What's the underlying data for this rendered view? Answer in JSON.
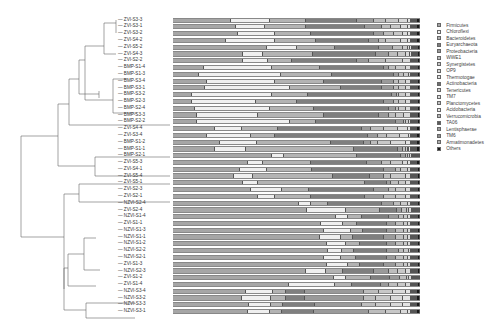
{
  "chart_data": {
    "type": "bar",
    "orientation": "horizontal",
    "stacked": true,
    "normalized_percent": true,
    "title": "",
    "xlabel": "",
    "ylabel": "",
    "xlim": [
      0,
      100
    ],
    "grid": false,
    "legend_position": "right",
    "has_dendrogram": true,
    "categories": [
      "ZVI-S3-3",
      "ZVI-S3-1",
      "ZVI-S3-2",
      "ZVI-S4-2",
      "ZVI-S5-2",
      "ZVI-S4-3",
      "ZVI-S2-2",
      "BMP-S1-4",
      "BMP-S1-3",
      "BMP-S3-4",
      "BMP-S3-1",
      "BMP-S3-2",
      "BMP-S2-3",
      "BMP-S2-4",
      "BMP-S3-3",
      "BMP-S2-2",
      "ZVI-S4-4",
      "ZVI-S3-4",
      "BMP-S1-2",
      "BMP-S1-1",
      "BMP-S2-1",
      "ZVI-S5-3",
      "ZVI-S4-1",
      "ZVI-S5-4",
      "ZVI-S5-1",
      "ZVI-S2-3",
      "ZVI-S2-1",
      "NZVI-S2-4",
      "ZVI-S2-4",
      "NZVI-S1-4",
      "ZVI-S1-1",
      "NZVI-S1-3",
      "NZVI-S1-1",
      "NZVI-S1-2",
      "NZVI-S2-2",
      "NZVI-S2-1",
      "ZVI-S1-3",
      "NZVI-S2-3",
      "ZVI-S1-2",
      "ZVI-S1-4",
      "NZVI-S3-4",
      "NZVI-S3-2",
      "NZVI-S3-3",
      "NZVI-S3-1"
    ],
    "legend": [
      "Firmicutes",
      "Chloroflexi",
      "Bacteroidetes",
      "Euryarchaeota",
      "Proteobacteria",
      "WWE1",
      "Synergistetes",
      "OP9",
      "Thermotogae",
      "Actinobacteria",
      "Tenericutes",
      "TM7",
      "Planctomycetes",
      "Acidobacteria",
      "Verrucomicrobia",
      "TA06",
      "Lentisphaerae",
      "TM6",
      "Armatimonadetes",
      "Others"
    ],
    "colors": [
      "#a6a6a6",
      "#efefef",
      "#b3b3b3",
      "#7f7f7f",
      "#9a9a9a",
      "#bdbdbd",
      "#c8c8c8",
      "#d9d9d9",
      "#e3e3e3",
      "#6e6e6e",
      "#cfcfcf",
      "#dedede",
      "#c2c2c2",
      "#e8e8e8",
      "#b8b8b8",
      "#5a5a5a",
      "#a0a0a0",
      "#909090",
      "#b0b0b0",
      "#1a1a1a"
    ],
    "series_values_note": "per-sample % for Firmicutes, Chloroflexi, Bacteroidetes, Euryarchaeota, Proteobacteria, then remaining small phyla lumped into listed order",
    "rows": [
      [
        24,
        16,
        15,
        21,
        7,
        5,
        5,
        4,
        1,
        0.5,
        0.5,
        0,
        0,
        0,
        0,
        0.5,
        0.2,
        0.1,
        0.1,
        1.1
      ],
      [
        26,
        12,
        17,
        24,
        7,
        4,
        4,
        3,
        1,
        0.5,
        0.5,
        0,
        0,
        0,
        0,
        0.5,
        0.2,
        0.1,
        0.1,
        1.1
      ],
      [
        27,
        15,
        15,
        26,
        4,
        4,
        4,
        2,
        1,
        0.5,
        0.5,
        0,
        0,
        0,
        0,
        0.5,
        0.2,
        0.1,
        0.1,
        1.1
      ],
      [
        22,
        20,
        17,
        22,
        4,
        3,
        6,
        3,
        1,
        0.5,
        0.5,
        0,
        0,
        0,
        0,
        0.5,
        0.2,
        0.1,
        0.1,
        1.1
      ],
      [
        39,
        12,
        16,
        18,
        6,
        4,
        2,
        1,
        0.5,
        0.5,
        0.3,
        0,
        0,
        0,
        0,
        0.3,
        0.2,
        0.1,
        0.1,
        0.9
      ],
      [
        29,
        8,
        21,
        26,
        5,
        4,
        3,
        2,
        0.5,
        0.5,
        0.3,
        0,
        0,
        0,
        0,
        0.3,
        0.2,
        0.1,
        0.1,
        0.9
      ],
      [
        29,
        10,
        10,
        27,
        5,
        7,
        7,
        3,
        0.5,
        0.3,
        0.2,
        0,
        0,
        0,
        0,
        0.3,
        0.2,
        0.1,
        0.1,
        0.9
      ],
      [
        13,
        28,
        20,
        27,
        2,
        3,
        4,
        2,
        0.5,
        0.3,
        0.2,
        0,
        0,
        0,
        0,
        0.3,
        0.2,
        0.1,
        0.1,
        0.8
      ],
      [
        11,
        34,
        21,
        26,
        2,
        2,
        2,
        1,
        0.3,
        0.2,
        0.2,
        0,
        0,
        0,
        0,
        0.3,
        0.2,
        0.1,
        0.1,
        0.8
      ],
      [
        14,
        28,
        20,
        24,
        5,
        2,
        3,
        2,
        0.3,
        0.2,
        0.2,
        0,
        0,
        0,
        0,
        0.3,
        0.2,
        0.1,
        0.1,
        0.8
      ],
      [
        13,
        35,
        21,
        17,
        5,
        2,
        3,
        2,
        0.3,
        0.2,
        0.2,
        0,
        0,
        0,
        0,
        0.3,
        0.2,
        0.1,
        0.1,
        0.8
      ],
      [
        8,
        33,
        15,
        35,
        2,
        1,
        3,
        2,
        0.3,
        0.2,
        0.2,
        0,
        0,
        0,
        0,
        0.3,
        0.2,
        0.1,
        0.1,
        0.8
      ],
      [
        8,
        26,
        17,
        36,
        4,
        2,
        3,
        2,
        0.3,
        0.2,
        0.2,
        0,
        0,
        0,
        0,
        0.3,
        0.2,
        0.1,
        0.1,
        0.8
      ],
      [
        9,
        31,
        18,
        31,
        3,
        1,
        3,
        2,
        0.3,
        0.2,
        0.2,
        0,
        0,
        0,
        0,
        0.3,
        0.2,
        0.1,
        0.1,
        0.8
      ],
      [
        10,
        25,
        27,
        23,
        4,
        3,
        3,
        3,
        0.3,
        0.2,
        0.2,
        0,
        0,
        0,
        0,
        0.3,
        0.2,
        0.1,
        0.1,
        0.8
      ],
      [
        10,
        38,
        11,
        33,
        3,
        1,
        1,
        1,
        0.3,
        0.2,
        0.2,
        0,
        0,
        0,
        0,
        0.3,
        0.2,
        0.1,
        0.1,
        0.8
      ],
      [
        17,
        11,
        15,
        34,
        4,
        5,
        6,
        4,
        1,
        0.5,
        0.5,
        0,
        0,
        0,
        0,
        0.5,
        0.2,
        0.1,
        0.1,
        1.1
      ],
      [
        14,
        18,
        10,
        38,
        4,
        4,
        5,
        4,
        0.5,
        0.5,
        0.5,
        0,
        0,
        0,
        0,
        0.5,
        0.2,
        0.1,
        0.1,
        1.1
      ],
      [
        19,
        15,
        30,
        13,
        3,
        3,
        5,
        6,
        2,
        0.5,
        0.5,
        0,
        0,
        0,
        0,
        0.5,
        0.2,
        0.1,
        0.1,
        1.1
      ],
      [
        17,
        13,
        44,
        18,
        2,
        1,
        1,
        0.5,
        0.5,
        0.5,
        0.5,
        0,
        0,
        0,
        0,
        0.5,
        0.2,
        0.1,
        0.1,
        1.1
      ],
      [
        41,
        5,
        30,
        18,
        2,
        1,
        1,
        0.5,
        0.5,
        0.3,
        0.2,
        0,
        0,
        0,
        0,
        0.3,
        0.2,
        0.1,
        0.1,
        0.5
      ],
      [
        31,
        6,
        20,
        23,
        6,
        4,
        5,
        2,
        1,
        0.5,
        0.5,
        0,
        0,
        0,
        0,
        0.5,
        0.2,
        0.1,
        0.1,
        1.1
      ],
      [
        28,
        11,
        19,
        30,
        5,
        2,
        3,
        1,
        0.5,
        0.3,
        0.2,
        0,
        0,
        0,
        0,
        0.3,
        0.2,
        0.1,
        0.1,
        0.8
      ],
      [
        25,
        8,
        33,
        15,
        6,
        3,
        6,
        2,
        0.5,
        0.3,
        0.2,
        0,
        0,
        0,
        0,
        0.3,
        0.2,
        0.1,
        0.1,
        0.8
      ],
      [
        29,
        6,
        44,
        9,
        2,
        3,
        3,
        2,
        0.5,
        0.3,
        0.2,
        0,
        0,
        0,
        0,
        0.3,
        0.2,
        0.1,
        0.1,
        0.8
      ],
      [
        32,
        13,
        11,
        27,
        6,
        3,
        4,
        2,
        0.5,
        0.3,
        0.2,
        0,
        0,
        0,
        0,
        0.3,
        0.2,
        0.1,
        0.1,
        0.8
      ],
      [
        35,
        7,
        15,
        22,
        8,
        5,
        4,
        2,
        0.5,
        0.3,
        0.2,
        0,
        0,
        0,
        0,
        0.3,
        0.2,
        0.1,
        0.1,
        0.8
      ],
      [
        52,
        5,
        7,
        22,
        5,
        3,
        3,
        1,
        0.5,
        0.3,
        0.2,
        0,
        0,
        0,
        0,
        0.3,
        0.2,
        0.1,
        0.1,
        0.9
      ],
      [
        55,
        16,
        14,
        7,
        2,
        2,
        1,
        1,
        0.5,
        0.3,
        0.2,
        0,
        0,
        0,
        0,
        0.3,
        0.2,
        0.1,
        0.1,
        0.5
      ],
      [
        67,
        5,
        6,
        11,
        4,
        2,
        2,
        1,
        0.5,
        0.3,
        0.2,
        0,
        0,
        0,
        0,
        0.3,
        0.2,
        0.1,
        0.1,
        0.8
      ],
      [
        61,
        9,
        6,
        12,
        4,
        3,
        2,
        1,
        0.5,
        0.3,
        0.2,
        0,
        0,
        0,
        0,
        0.3,
        0.2,
        0.1,
        0.1,
        0.8
      ],
      [
        63,
        11,
        5,
        10,
        4,
        3,
        2,
        1,
        0.5,
        0.3,
        0.2,
        0,
        0,
        0,
        0,
        0.3,
        0.2,
        0.1,
        0.1,
        0.8
      ],
      [
        61,
        9,
        5,
        13,
        5,
        3,
        2,
        1,
        0.5,
        0.3,
        0.2,
        0,
        0,
        0,
        0,
        0.3,
        0.2,
        0.1,
        0.1,
        0.8
      ],
      [
        64,
        8,
        6,
        11,
        4,
        3,
        2,
        1,
        0.5,
        0.3,
        0.2,
        0,
        0,
        0,
        0,
        0.3,
        0.2,
        0.1,
        0.1,
        0.8
      ],
      [
        65,
        6,
        5,
        14,
        5,
        2,
        2,
        1,
        0.5,
        0.3,
        0.2,
        0,
        0,
        0,
        0,
        0.3,
        0.2,
        0.1,
        0.1,
        0.8
      ],
      [
        63,
        7,
        6,
        13,
        4,
        3,
        2,
        1,
        0.5,
        0.3,
        0.2,
        0,
        0,
        0,
        0,
        0.3,
        0.2,
        0.1,
        0.1,
        0.8
      ],
      [
        64,
        9,
        5,
        10,
        5,
        3,
        2,
        1,
        0.5,
        0.3,
        0.2,
        0,
        0,
        0,
        0,
        0.3,
        0.2,
        0.1,
        0.1,
        0.8
      ],
      [
        55,
        8,
        7,
        13,
        6,
        4,
        3,
        2,
        0.5,
        0.3,
        0.2,
        0,
        0,
        0,
        0,
        0.3,
        0.2,
        0.1,
        0.1,
        0.9
      ],
      [
        67,
        5,
        10,
        8,
        4,
        3,
        1,
        1,
        0.5,
        0.3,
        0.2,
        0,
        0,
        0,
        0,
        0.3,
        0.2,
        0.1,
        0.1,
        0.5
      ],
      [
        48,
        19,
        7,
        12,
        3,
        4,
        3,
        2,
        0.5,
        0.3,
        0.2,
        0,
        0,
        0,
        0,
        0.3,
        0.2,
        0.1,
        0.1,
        0.9
      ],
      [
        30,
        11,
        5,
        8,
        24,
        6,
        6,
        5,
        2,
        0.5,
        0.5,
        0,
        0,
        0,
        0,
        0.5,
        0.2,
        0.1,
        0.1,
        1.1
      ],
      [
        28,
        12,
        6,
        8,
        24,
        5,
        6,
        5,
        3,
        0.5,
        0.5,
        0,
        0,
        0,
        0,
        0.5,
        0.2,
        0.1,
        0.1,
        1.1
      ],
      [
        31,
        9,
        5,
        13,
        19,
        6,
        6,
        5,
        3,
        0.5,
        0.5,
        0,
        0,
        0,
        0,
        0.5,
        0.2,
        0.1,
        0.1,
        1.1
      ],
      [
        31,
        9,
        5,
        13,
        23,
        7,
        6,
        3,
        1,
        0.5,
        0.5,
        0,
        0,
        0,
        0,
        0.5,
        0.2,
        0.1,
        0.1,
        1.1
      ]
    ]
  },
  "legend_title": ""
}
